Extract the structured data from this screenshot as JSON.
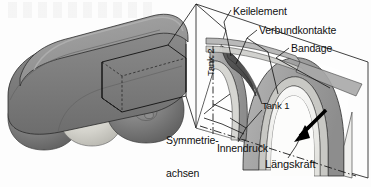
{
  "figure": {
    "language": "de"
  },
  "labels": {
    "keilelement": "Keilelement",
    "verbundkontakte": "Verbundkontakte",
    "bandage": "Bandage",
    "tank2": "Tank 2",
    "tank1": "Tank 1",
    "symmetrieachsen_line1": "Symmetrie-",
    "symmetrieachsen_line2": "achsen",
    "innendruck": "Innendruck",
    "laengskraft": "Längskraft"
  },
  "colors": {
    "body_shell": "#8a8a8a",
    "body_shell_top": "#9b9b9b",
    "body_shell_dark": "#6e6e6e",
    "tank_dark": "#767676",
    "tank_mid": "#c9c9c4",
    "bandage_gray": "#a8a8a8",
    "bandage_light": "#d8d8d6",
    "wedge_dark": "#4e4e4e",
    "liner_white": "#f4f4f2",
    "outline": "#1a1a1a",
    "arrow_black": "#000000",
    "background": "#fdfdfd"
  },
  "components": [
    {
      "name": "Keilelement",
      "description": "dunkles Keilelement im Zwickel zwischen den Tanks"
    },
    {
      "name": "Verbundkontakte",
      "description": "Kontaktflaechen zwischen Bandage und Tankwand"
    },
    {
      "name": "Bandage",
      "description": "aeussere umlaufende Verstaerkungsbandage"
    },
    {
      "name": "Tank 1",
      "description": "rechte Tankzelle im Schnitt"
    },
    {
      "name": "Tank 2",
      "description": "linke Tankzelle im Schnitt"
    },
    {
      "name": "Symmetrieachsen",
      "description": "Strichpunktlinien der Symmetrieebenen"
    },
    {
      "name": "Innendruck",
      "description": "Innendruck wirkt auf die Tankinnenwand"
    },
    {
      "name": "Längskraft",
      "description": "Laengskraft entlang der Tankachse, schwarzer Pfeil"
    }
  ]
}
